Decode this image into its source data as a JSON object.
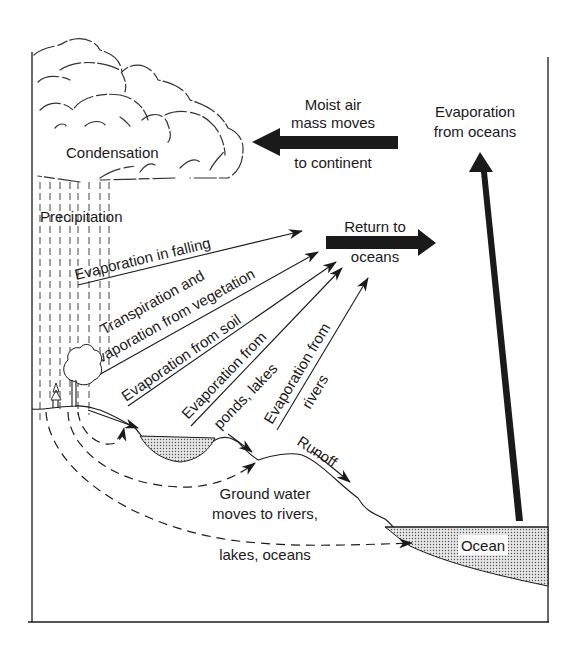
{
  "diagram": {
    "labels": {
      "condensation": "Condensation",
      "precipitation": "Precipitation",
      "moist_air_1": "Moist air",
      "moist_air_2": "mass moves",
      "moist_air_3": "to continent",
      "evap_oceans_1": "Evaporation",
      "evap_oceans_2": "from oceans",
      "return_1": "Return to",
      "return_2": "oceans",
      "evap_falling": "Evaporation in falling",
      "transp_1": "Transpiration and",
      "transp_2": "Evaporation from vegetation",
      "evap_soil": "Evaporation from soil",
      "evap_ponds_1": "Evaporation from",
      "evap_ponds_2": "ponds, lakes",
      "evap_rivers_1": "Evaporation from",
      "evap_rivers_2": "rivers",
      "runoff": "Runoff",
      "ground_1": "Ground water",
      "ground_2": "moves to rivers,",
      "ground_3": "lakes, oceans",
      "ocean": "Ocean"
    },
    "colors": {
      "ink": "#1a1a1a",
      "water_fill": "#c8c8c8",
      "background": "#ffffff"
    }
  }
}
